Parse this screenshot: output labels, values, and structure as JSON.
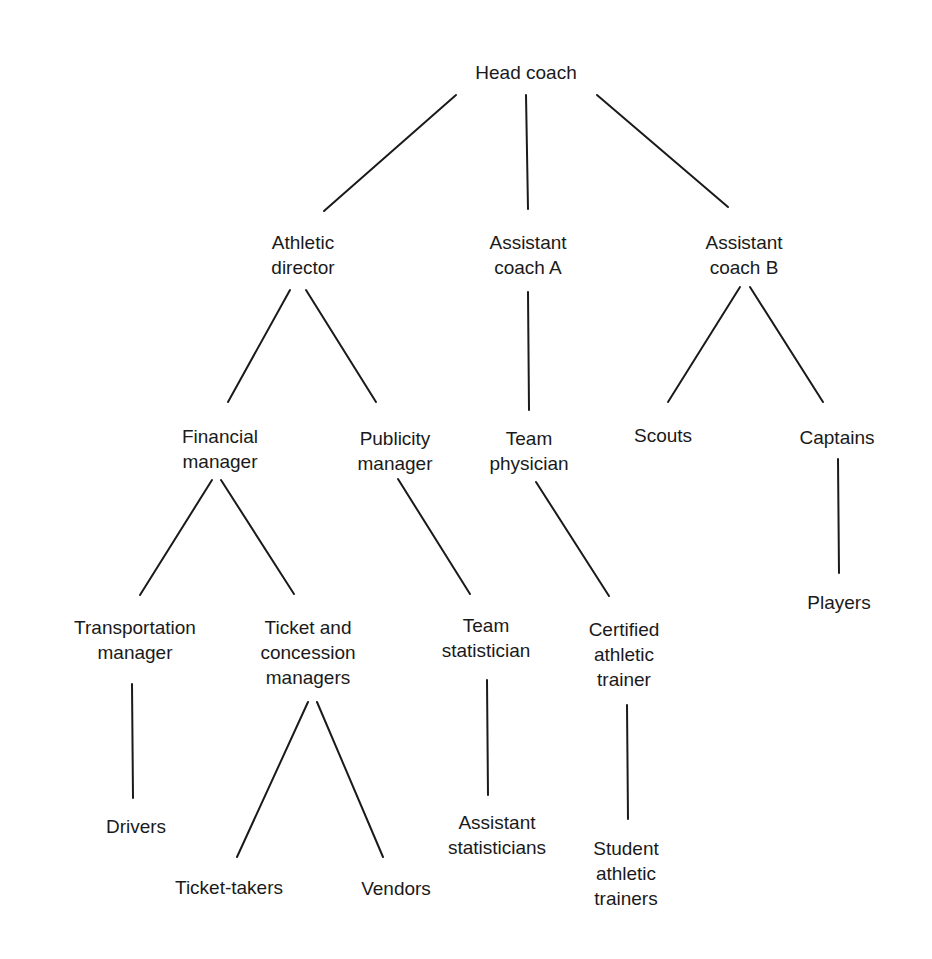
{
  "diagram": {
    "type": "organizational-chart",
    "nodes": {
      "head_coach": {
        "lines": [
          "Head coach"
        ],
        "x": 526,
        "y": 60
      },
      "athletic_director": {
        "lines": [
          "Athletic",
          "director"
        ],
        "x": 303,
        "y": 230
      },
      "assistant_coach_a": {
        "lines": [
          "Assistant",
          "coach A"
        ],
        "x": 528,
        "y": 230
      },
      "assistant_coach_b": {
        "lines": [
          "Assistant",
          "coach B"
        ],
        "x": 744,
        "y": 230
      },
      "financial_manager": {
        "lines": [
          "Financial",
          "manager"
        ],
        "x": 220,
        "y": 424
      },
      "publicity_manager": {
        "lines": [
          "Publicity",
          "manager"
        ],
        "x": 395,
        "y": 426
      },
      "team_physician": {
        "lines": [
          "Team",
          "physician"
        ],
        "x": 529,
        "y": 426
      },
      "scouts": {
        "lines": [
          "Scouts"
        ],
        "x": 663,
        "y": 423
      },
      "captains": {
        "lines": [
          "Captains"
        ],
        "x": 837,
        "y": 425
      },
      "transportation_manager": {
        "lines": [
          "Transportation",
          "manager"
        ],
        "x": 135,
        "y": 615
      },
      "ticket_concession_managers": {
        "lines": [
          "Ticket and",
          "concession",
          "managers"
        ],
        "x": 308,
        "y": 615
      },
      "team_statistician": {
        "lines": [
          "Team",
          "statistician"
        ],
        "x": 486,
        "y": 613
      },
      "certified_athletic_trainer": {
        "lines": [
          "Certified",
          "athletic",
          "trainer"
        ],
        "x": 624,
        "y": 617
      },
      "players": {
        "lines": [
          "Players"
        ],
        "x": 839,
        "y": 590
      },
      "drivers": {
        "lines": [
          "Drivers"
        ],
        "x": 136,
        "y": 814
      },
      "ticket_takers": {
        "lines": [
          "Ticket-takers"
        ],
        "x": 229,
        "y": 875
      },
      "vendors": {
        "lines": [
          "Vendors"
        ],
        "x": 396,
        "y": 876
      },
      "assistant_statisticians": {
        "lines": [
          "Assistant",
          "statisticians"
        ],
        "x": 497,
        "y": 810
      },
      "student_athletic_trainers": {
        "lines": [
          "Student",
          "athletic",
          "trainers"
        ],
        "x": 626,
        "y": 836
      }
    },
    "edges": [
      {
        "from": "head_coach",
        "to": "athletic_director",
        "x1": 456,
        "y1": 95,
        "x2": 324,
        "y2": 211
      },
      {
        "from": "head_coach",
        "to": "assistant_coach_a",
        "x1": 526,
        "y1": 95,
        "x2": 528,
        "y2": 209
      },
      {
        "from": "head_coach",
        "to": "assistant_coach_b",
        "x1": 597,
        "y1": 95,
        "x2": 728,
        "y2": 207
      },
      {
        "from": "athletic_director",
        "to": "financial_manager",
        "x1": 290,
        "y1": 290,
        "x2": 228,
        "y2": 402
      },
      {
        "from": "athletic_director",
        "to": "publicity_manager",
        "x1": 306,
        "y1": 290,
        "x2": 376,
        "y2": 402
      },
      {
        "from": "assistant_coach_a",
        "to": "team_physician",
        "x1": 528,
        "y1": 292,
        "x2": 529,
        "y2": 410
      },
      {
        "from": "assistant_coach_b",
        "to": "scouts",
        "x1": 740,
        "y1": 287,
        "x2": 668,
        "y2": 402
      },
      {
        "from": "assistant_coach_b",
        "to": "captains",
        "x1": 750,
        "y1": 287,
        "x2": 823,
        "y2": 402
      },
      {
        "from": "financial_manager",
        "to": "transportation_manager",
        "x1": 212,
        "y1": 480,
        "x2": 140,
        "y2": 595
      },
      {
        "from": "financial_manager",
        "to": "ticket_concession_managers",
        "x1": 221,
        "y1": 480,
        "x2": 294,
        "y2": 594
      },
      {
        "from": "publicity_manager",
        "to": "team_statistician",
        "x1": 398,
        "y1": 479,
        "x2": 470,
        "y2": 594
      },
      {
        "from": "team_physician",
        "to": "certified_athletic_trainer",
        "x1": 536,
        "y1": 482,
        "x2": 609,
        "y2": 596
      },
      {
        "from": "captains",
        "to": "players",
        "x1": 838,
        "y1": 459,
        "x2": 839,
        "y2": 573
      },
      {
        "from": "transportation_manager",
        "to": "drivers",
        "x1": 132,
        "y1": 684,
        "x2": 133,
        "y2": 798
      },
      {
        "from": "ticket_concession_managers",
        "to": "ticket_takers",
        "x1": 308,
        "y1": 702,
        "x2": 237,
        "y2": 857
      },
      {
        "from": "ticket_concession_managers",
        "to": "vendors",
        "x1": 317,
        "y1": 702,
        "x2": 383,
        "y2": 857
      },
      {
        "from": "team_statistician",
        "to": "assistant_statisticians",
        "x1": 487,
        "y1": 680,
        "x2": 488,
        "y2": 795
      },
      {
        "from": "certified_athletic_trainer",
        "to": "student_athletic_trainers",
        "x1": 627,
        "y1": 705,
        "x2": 628,
        "y2": 819
      }
    ],
    "colors": {
      "line": "#1a1a1a",
      "text": "#1a1a1a",
      "background": "#ffffff"
    }
  }
}
